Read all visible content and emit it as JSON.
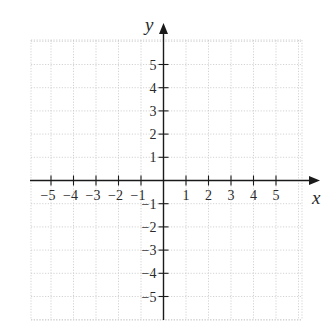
{
  "chart_data": {
    "type": "line",
    "title": "",
    "xlabel": "x",
    "ylabel": "y",
    "xlim": [
      -6,
      6
    ],
    "ylim": [
      -6,
      6
    ],
    "grid": true,
    "grid_style": "dotted",
    "x_ticks": [
      -5,
      -4,
      -3,
      -2,
      -1,
      1,
      2,
      3,
      4,
      5
    ],
    "y_ticks": [
      5,
      4,
      3,
      2,
      1,
      -1,
      -2,
      -3,
      -4,
      -5
    ],
    "x_tick_labels": [
      "−5",
      "−4",
      "−3",
      "−2",
      "−1",
      "1",
      "2",
      "3",
      "4",
      "5"
    ],
    "y_tick_labels": [
      "5",
      "4",
      "3",
      "2",
      "1",
      "−1",
      "−2",
      "−3",
      "−4",
      "−5"
    ],
    "series": [],
    "legend": null
  },
  "axes": {
    "x_label": "x",
    "y_label": "y",
    "axis_color": "#1a1a1a",
    "grid_color": "#c8c8c8"
  }
}
